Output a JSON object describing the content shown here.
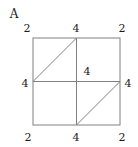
{
  "figure": {
    "title": "A",
    "type": "grid-diagram",
    "style": {
      "line_color": "#808080",
      "text_color": "#1a1a1a",
      "background": "#ffffff",
      "line_width": 1
    },
    "square": {
      "x": 33,
      "y": 38,
      "width": 87,
      "height": 87
    },
    "grid_lines": [
      {
        "name": "vertical-center-line",
        "x1": 76.5,
        "y1": 38,
        "x2": 76.5,
        "y2": 125
      },
      {
        "name": "horizontal-center-line",
        "x1": 33,
        "y1": 81.5,
        "x2": 120,
        "y2": 81.5
      }
    ],
    "diagonals": [
      {
        "name": "diagonal-upper-left",
        "x1": 33,
        "y1": 81.5,
        "x2": 76.5,
        "y2": 38
      },
      {
        "name": "diagonal-lower-right",
        "x1": 76.5,
        "y1": 125,
        "x2": 120,
        "y2": 81.5
      }
    ],
    "labels": [
      {
        "name": "label-top-left-corner",
        "text": "2",
        "x": 27,
        "y": 28
      },
      {
        "name": "label-top-middle",
        "text": "4",
        "x": 76,
        "y": 28
      },
      {
        "name": "label-top-right-corner",
        "text": "2",
        "x": 122,
        "y": 28
      },
      {
        "name": "label-left-middle",
        "text": "4",
        "x": 25,
        "y": 83
      },
      {
        "name": "label-center",
        "text": "4",
        "x": 87,
        "y": 71
      },
      {
        "name": "label-right-middle",
        "text": "4",
        "x": 128,
        "y": 83
      },
      {
        "name": "label-bottom-left-corner",
        "text": "2",
        "x": 28,
        "y": 137
      },
      {
        "name": "label-bottom-middle",
        "text": "4",
        "x": 76,
        "y": 137
      },
      {
        "name": "label-bottom-right-corner",
        "text": "2",
        "x": 122,
        "y": 137
      }
    ],
    "title_position": {
      "x": 14,
      "y": 14
    }
  },
  "chart_data": {
    "type": "table",
    "title": "A",
    "categories": [
      "top-left corner",
      "top middle",
      "top-right corner",
      "left middle",
      "center",
      "right middle",
      "bottom-left corner",
      "bottom middle",
      "bottom-right corner"
    ],
    "values": [
      2,
      4,
      2,
      4,
      4,
      4,
      2,
      4,
      2
    ],
    "xlabel": "",
    "ylabel": "",
    "grid": true,
    "legend": "none"
  }
}
